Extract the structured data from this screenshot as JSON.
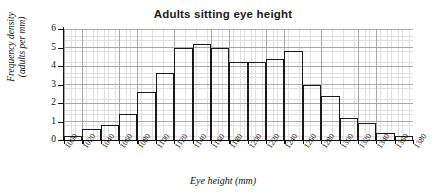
{
  "chart_data": {
    "type": "bar",
    "title": "Adults sitting eye height",
    "xlabel": "Eye height (mm)",
    "ylabel_line1": "Frequency density",
    "ylabel_line2": "(adults per mm)",
    "xlim": [
      1000,
      1380
    ],
    "ylim": [
      0,
      6
    ],
    "grid": true,
    "legend": "none",
    "y_ticks": [
      0,
      1,
      2,
      3,
      4,
      5,
      6
    ],
    "x_ticks": [
      1000,
      1020,
      1040,
      1060,
      1080,
      1100,
      1120,
      1140,
      1160,
      1180,
      1200,
      1220,
      1240,
      1260,
      1280,
      1300,
      1320,
      1340,
      1360,
      1380
    ],
    "bin_width": 20,
    "bin_edges": [
      1000,
      1020,
      1040,
      1060,
      1080,
      1100,
      1120,
      1140,
      1160,
      1180,
      1200,
      1220,
      1240,
      1260,
      1280,
      1300,
      1320,
      1340,
      1360,
      1380
    ],
    "categories": [
      "1000-1020",
      "1020-1040",
      "1040-1060",
      "1060-1080",
      "1080-1100",
      "1100-1120",
      "1120-1140",
      "1140-1160",
      "1160-1180",
      "1180-1200",
      "1200-1220",
      "1220-1240",
      "1240-1260",
      "1260-1280",
      "1280-1300",
      "1300-1320",
      "1320-1340",
      "1340-1360",
      "1360-1380"
    ],
    "values": [
      0.2,
      0.6,
      0.8,
      1.4,
      2.6,
      3.6,
      5.0,
      5.2,
      5.0,
      4.2,
      4.2,
      4.4,
      4.8,
      3.0,
      2.4,
      1.2,
      0.9,
      0.4,
      0.2
    ],
    "bar_color": "#ffffff",
    "bar_edge_color": "#1a1a1a",
    "grid_color": "#d6d6d6",
    "axis_color": "#111111"
  }
}
